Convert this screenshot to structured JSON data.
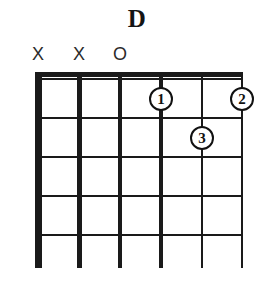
{
  "chord": {
    "name": "D",
    "instrument": "guitar",
    "string_count": 6,
    "fret_count": 5,
    "base_fret": 1,
    "nut": true
  },
  "open_mute_markers": [
    {
      "string": 1,
      "symbol": "X",
      "meaning": "muted"
    },
    {
      "string": 2,
      "symbol": "X",
      "meaning": "muted"
    },
    {
      "string": 3,
      "symbol": "O",
      "meaning": "open"
    },
    {
      "string": 4,
      "symbol": "",
      "meaning": "fretted"
    },
    {
      "string": 5,
      "symbol": "",
      "meaning": "fretted"
    },
    {
      "string": 6,
      "symbol": "",
      "meaning": "fretted"
    }
  ],
  "finger_positions": [
    {
      "label": "1",
      "string": 4,
      "fret": 2
    },
    {
      "label": "2",
      "string": 6,
      "fret": 2
    },
    {
      "label": "3",
      "string": 5,
      "fret": 3
    }
  ],
  "geometry": {
    "grid_left": 38,
    "grid_right": 242,
    "grid_top": 72,
    "string_bottom": 268,
    "string_x": [
      38,
      79,
      120,
      161,
      202,
      242
    ],
    "string_width": [
      7,
      5,
      4,
      3.5,
      2.2,
      1.6
    ],
    "fret_y": [
      79,
      118,
      157,
      196,
      235
    ],
    "nut_y": 72,
    "nut_thickness": 5,
    "marker_y": 55,
    "dot_radius": 12
  },
  "colors": {
    "background": "#ffffff",
    "ink": "#111111",
    "marker_ink": "#2b2b2b",
    "fret_line": "#1a1a1a",
    "dot_fill": "#ffffff"
  }
}
